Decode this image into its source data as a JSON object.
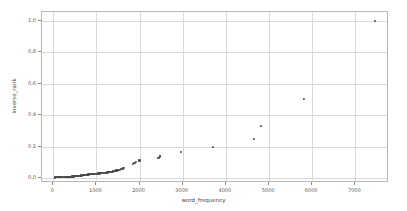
{
  "chart_data": {
    "type": "scatter",
    "title": "",
    "xlabel": "word_frequency",
    "ylabel": "inverse_rank",
    "xlim": [
      -260,
      7780
    ],
    "ylim": [
      -0.032,
      1.055
    ],
    "xticks": [
      0,
      1000,
      2000,
      3000,
      4000,
      5000,
      6000,
      7000
    ],
    "xticklabels": [
      "0",
      "1000",
      "2000",
      "3000",
      "4000",
      "5000",
      "6000",
      "7000"
    ],
    "yticks": [
      0.0,
      0.2,
      0.4,
      0.6,
      0.8,
      1.0
    ],
    "yticklabels": [
      "0.0",
      "0.2",
      "0.4",
      "0.6",
      "0.8",
      "1.0"
    ],
    "grid": true,
    "legend": null,
    "marker_color": "#4a4a4a",
    "grid_color": "#d9d9d9",
    "axes_color": "#b8b8b8",
    "background_color": "#ffffff",
    "points": [
      [
        30,
        0.004
      ],
      [
        55,
        0.0042
      ],
      [
        78,
        0.0044
      ],
      [
        100,
        0.0046
      ],
      [
        120,
        0.0048
      ],
      [
        142,
        0.005
      ],
      [
        163,
        0.0052
      ],
      [
        185,
        0.0054
      ],
      [
        205,
        0.0057
      ],
      [
        226,
        0.0059
      ],
      [
        248,
        0.0062
      ],
      [
        268,
        0.0065
      ],
      [
        289,
        0.0068
      ],
      [
        310,
        0.0071
      ],
      [
        330,
        0.0074
      ],
      [
        351,
        0.0078
      ],
      [
        372,
        0.0082
      ],
      [
        392,
        0.0086
      ],
      [
        413,
        0.009
      ],
      [
        434,
        0.0095
      ],
      [
        454,
        0.01
      ],
      [
        475,
        0.0105
      ],
      [
        495,
        0.011
      ],
      [
        516,
        0.0116
      ],
      [
        537,
        0.0122
      ],
      [
        557,
        0.0128
      ],
      [
        578,
        0.0135
      ],
      [
        598,
        0.0142
      ],
      [
        619,
        0.0149
      ],
      [
        640,
        0.0157
      ],
      [
        660,
        0.0165
      ],
      [
        681,
        0.0174
      ],
      [
        701,
        0.0182
      ],
      [
        722,
        0.0192
      ],
      [
        742,
        0.02
      ],
      [
        763,
        0.0208
      ],
      [
        784,
        0.0217
      ],
      [
        804,
        0.0222
      ],
      [
        825,
        0.0227
      ],
      [
        845,
        0.0233
      ],
      [
        866,
        0.0238
      ],
      [
        887,
        0.0244
      ],
      [
        907,
        0.025
      ],
      [
        928,
        0.0256
      ],
      [
        948,
        0.0263
      ],
      [
        969,
        0.027
      ],
      [
        990,
        0.027
      ],
      [
        1010,
        0.0278
      ],
      [
        1031,
        0.0286
      ],
      [
        1051,
        0.0286
      ],
      [
        1072,
        0.0294
      ],
      [
        1093,
        0.0303
      ],
      [
        1113,
        0.0303
      ],
      [
        1134,
        0.0312
      ],
      [
        1154,
        0.0323
      ],
      [
        1175,
        0.0323
      ],
      [
        1196,
        0.0333
      ],
      [
        1216,
        0.0345
      ],
      [
        1237,
        0.0345
      ],
      [
        1257,
        0.0357
      ],
      [
        1278,
        0.037
      ],
      [
        1299,
        0.037
      ],
      [
        1319,
        0.0385
      ],
      [
        1340,
        0.04
      ],
      [
        1360,
        0.04
      ],
      [
        1381,
        0.0417
      ],
      [
        1402,
        0.0435
      ],
      [
        1422,
        0.0435
      ],
      [
        1443,
        0.0455
      ],
      [
        1463,
        0.0476
      ],
      [
        1484,
        0.0476
      ],
      [
        1505,
        0.05
      ],
      [
        1525,
        0.0526
      ],
      [
        1546,
        0.0526
      ],
      [
        1566,
        0.0556
      ],
      [
        1587,
        0.0588
      ],
      [
        1608,
        0.0588
      ],
      [
        1628,
        0.0625
      ],
      [
        1850,
        0.0909
      ],
      [
        1880,
        0.095
      ],
      [
        1910,
        0.1
      ],
      [
        1990,
        0.1111
      ],
      [
        2010,
        0.1111
      ],
      [
        2420,
        0.125
      ],
      [
        2450,
        0.13
      ],
      [
        2470,
        0.137
      ],
      [
        2480,
        0.14
      ],
      [
        2950,
        0.1667
      ],
      [
        3700,
        0.2
      ],
      [
        4650,
        0.25
      ],
      [
        4820,
        0.3333
      ],
      [
        5800,
        0.5
      ],
      [
        7450,
        1.0
      ]
    ]
  }
}
